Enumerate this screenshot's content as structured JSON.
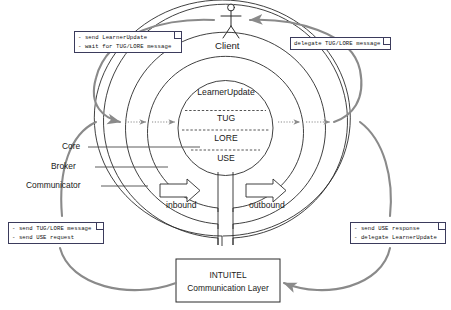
{
  "diagram": {
    "colors": {
      "stroke_dark": "#2b2b2b",
      "stroke_gray": "#8a8a8a",
      "note_border": "#3b3b5c",
      "background": "#ffffff",
      "text": "#1a1a1a"
    },
    "actor": {
      "name": "Client",
      "label": "Client"
    },
    "core_circle": {
      "layers": [
        "LearnerUpdate",
        "TUG",
        "LORE",
        "USE"
      ]
    },
    "ring_labels": [
      "Core",
      "Broker",
      "Communicator"
    ],
    "flow_arrows": [
      "inbound",
      "outbound"
    ],
    "bottom_box": {
      "line1": "INTUITEL",
      "line2": "Communication Layer"
    },
    "notes": [
      {
        "id": "note-client-send",
        "lines": [
          "- send LearnerUpdate",
          "- wait for TUG/LORE message"
        ]
      },
      {
        "id": "note-client-delegate",
        "lines": [
          "delegate TUG/LORE message"
        ]
      },
      {
        "id": "note-comm-send",
        "lines": [
          "- send TUG/LORE message",
          "- send USE request"
        ]
      },
      {
        "id": "note-comm-response",
        "lines": [
          "- send USE response",
          "- delegate LearnerUpdate"
        ]
      }
    ]
  }
}
